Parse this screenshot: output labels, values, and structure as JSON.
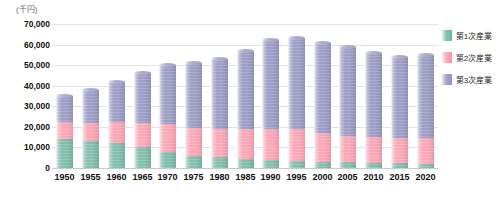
{
  "chart_data": {
    "type": "bar",
    "stacked": true,
    "title": "",
    "subtitle": "",
    "unit_label": "(千円)",
    "xlabel": "",
    "ylabel": "",
    "ylim": [
      0,
      70000
    ],
    "ytick_step": 10000,
    "ytick_labels": [
      "70,000",
      "60,000",
      "50,000",
      "40,000",
      "30,000",
      "20,000",
      "10,000",
      "0"
    ],
    "ytick_values": [
      70000,
      60000,
      50000,
      40000,
      30000,
      20000,
      10000,
      0
    ],
    "grid": true,
    "legend_position": "right",
    "categories": [
      "1950",
      "1955",
      "1960",
      "1965",
      "1970",
      "1975",
      "1980",
      "1985",
      "1990",
      "1995",
      "2000",
      "2005",
      "2010",
      "2015",
      "2020"
    ],
    "series": [
      {
        "name": "第1次産業",
        "color": "#83bfae",
        "values": [
          14200,
          13200,
          12000,
          10000,
          8000,
          6000,
          5200,
          4400,
          3900,
          3400,
          3000,
          2800,
          2500,
          2200,
          2100
        ]
      },
      {
        "name": "第2次産業",
        "color": "#fba7b6",
        "values": [
          8000,
          8800,
          10200,
          11800,
          13400,
          13600,
          13800,
          14400,
          15300,
          15400,
          14000,
          13000,
          12400,
          12300,
          12400
        ]
      },
      {
        "name": "第3次産業",
        "color": "#9e9ec6",
        "values": [
          12800,
          16000,
          19800,
          24200,
          28600,
          31400,
          34000,
          38200,
          42800,
          44200,
          44000,
          43200,
          41100,
          39500,
          40500
        ]
      }
    ],
    "totals": [
      35000,
      38000,
      42000,
      46000,
      50000,
      51000,
      53000,
      57000,
      62000,
      63000,
      61000,
      59000,
      56000,
      54000,
      55000
    ]
  },
  "legend": {
    "items": [
      {
        "label": "第1次産業",
        "color": "#83bfae"
      },
      {
        "label": "第2次産業",
        "color": "#fba7b6"
      },
      {
        "label": "第3次産業",
        "color": "#9e9ec6"
      }
    ]
  }
}
